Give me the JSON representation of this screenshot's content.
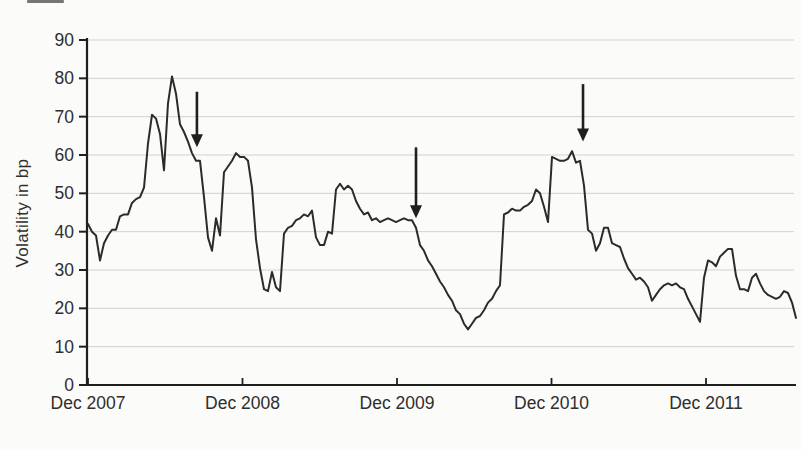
{
  "figure": {
    "background_color": "#fbfbf9",
    "axis_color": "#1f1f1d",
    "text_color": "#2e2e2c"
  },
  "chart_data": {
    "type": "line",
    "title": "",
    "xlabel": "",
    "ylabel": "Volatility in bp",
    "ylim": [
      0,
      90
    ],
    "ytick_step": 10,
    "ytick_labels": [
      "0",
      "10",
      "20",
      "30",
      "40",
      "50",
      "60",
      "70",
      "80",
      "90"
    ],
    "xtick_labels": [
      "Dec 2007",
      "Dec 2008",
      "Dec 2009",
      "Dec 2010",
      "Dec 2011"
    ],
    "xticks_years": [
      0,
      1,
      2,
      3,
      4
    ],
    "xlim_years": [
      0,
      4.583
    ],
    "grid": "horizontal-light",
    "grid_color": "#c9c9c4",
    "line_color": "#2b2b29",
    "legend": "none",
    "series": [
      {
        "name": "volatility_bp",
        "x_start_year": 0,
        "x_step_year": 0.02589,
        "values": [
          42,
          40,
          39,
          32.5,
          37,
          39,
          40.5,
          40.5,
          44,
          44.5,
          44.5,
          47.5,
          48.5,
          49,
          51.5,
          63,
          70.5,
          69.5,
          65.5,
          56,
          73.5,
          80.5,
          76,
          68,
          66,
          63.5,
          60.5,
          58.5,
          58.5,
          49,
          38.5,
          35,
          43.5,
          39,
          55.5,
          57,
          58.5,
          60.5,
          59.5,
          59.5,
          58.5,
          51.5,
          38,
          30.5,
          25,
          24.5,
          29.5,
          25.5,
          24.5,
          39.5,
          41,
          41.5,
          43,
          43.5,
          44.5,
          44,
          45.5,
          38.5,
          36.5,
          36.5,
          40,
          39.5,
          51,
          52.5,
          51,
          52,
          51,
          48,
          46,
          44.5,
          45,
          43,
          43.5,
          42.5,
          43,
          43.5,
          43,
          42.5,
          43,
          43.5,
          43,
          43,
          41,
          36.5,
          35,
          32.5,
          31,
          29,
          27,
          25.5,
          23.5,
          22,
          19.5,
          18.5,
          16,
          14.5,
          16,
          17.5,
          18,
          19.5,
          21.5,
          22.5,
          24.5,
          26,
          44.5,
          45,
          46,
          45.5,
          45.5,
          46.5,
          47,
          48,
          51,
          50,
          46.5,
          42.5,
          59.5,
          59,
          58.5,
          58.5,
          59,
          61,
          58,
          58.5,
          52,
          40.5,
          39.5,
          35,
          37,
          41,
          41,
          37,
          36.5,
          36,
          33,
          30.5,
          29,
          27.5,
          28,
          27,
          25.5,
          22,
          23.5,
          25,
          26,
          26.5,
          26,
          26.5,
          25.5,
          25,
          22.5,
          20.5,
          18.5,
          16.5,
          28,
          32.5,
          32,
          31,
          33.5,
          34.5,
          35.5,
          35.5,
          28.5,
          25,
          25,
          24.5,
          28,
          29,
          26.5,
          24.5,
          23.5,
          23,
          22.5,
          23,
          24.5,
          24,
          21.5,
          17.5
        ]
      }
    ],
    "annotations": [
      {
        "type": "arrow",
        "direction": "down",
        "x_year": 0.705,
        "y_from_bp": 76.5,
        "y_to_bp": 62
      },
      {
        "type": "arrow",
        "direction": "down",
        "x_year": 2.123,
        "y_from_bp": 62,
        "y_to_bp": 43.5
      },
      {
        "type": "arrow",
        "direction": "down",
        "x_year": 3.204,
        "y_from_bp": 78.5,
        "y_to_bp": 63.5
      }
    ]
  }
}
